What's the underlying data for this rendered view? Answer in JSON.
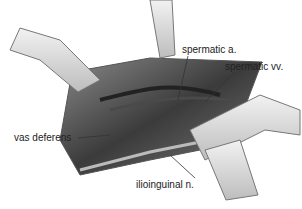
{
  "figure": {
    "labels": {
      "spermatic_a": "spermatic a.",
      "spermatic_vv": "spermatic vv.",
      "vas_deferens": "vas deferens",
      "ilioinguinal_n": "ilioinguinal n."
    },
    "colors": {
      "tissue_dark": "#3a3a3a",
      "tissue_mid": "#6b6b6b",
      "retractor": "#d8d8d8",
      "outline": "#555555"
    }
  }
}
